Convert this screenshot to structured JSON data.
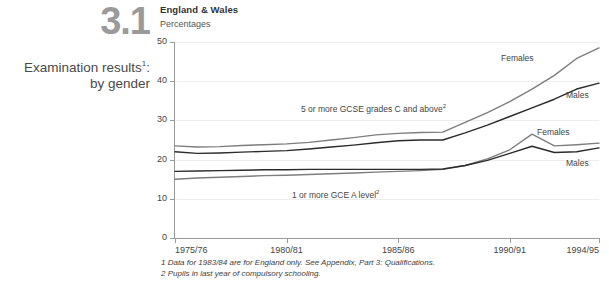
{
  "figure": {
    "number": "3.1",
    "title_line1": "Examination results",
    "title_sup": "1",
    "title_line1_suffix": ":",
    "title_line2": "by gender",
    "region": "England & Wales",
    "units": "Percentages"
  },
  "footnotes": [
    "1 Data for 1983/84 are for England only. See Appendix, Part 3: Qualifications.",
    "2 Pupils in last year of compulsory schooling."
  ],
  "annotations": {
    "gcse": "5 or more GCSE grades C and above",
    "gcse_sup": "2",
    "alevel": "1 or more GCE A level",
    "alevel_sup": "2",
    "gcse_females": "Females",
    "gcse_males": "Males",
    "alevel_females": "Females",
    "alevel_males": "Males"
  },
  "colors": {
    "females_line": "#7d7d7d",
    "males_line": "#2b2b2b",
    "grid": "#ededed",
    "axis": "#9a9a9a",
    "figure_number": "#9a9a9a"
  },
  "chart_data": {
    "type": "line",
    "subtitle": "England & Wales",
    "xlabel": "",
    "ylabel": "Percentages",
    "ylim": [
      0,
      50
    ],
    "yticks": [
      0,
      10,
      20,
      30,
      40,
      50
    ],
    "ytick_labels": [
      "0",
      "10",
      "20",
      "30",
      "40",
      "50"
    ],
    "grid": true,
    "legend": "inline-labels",
    "x": [
      "1975/76",
      "1976/77",
      "1977/78",
      "1978/79",
      "1979/80",
      "1980/81",
      "1981/82",
      "1982/83",
      "1983/84",
      "1984/85",
      "1985/86",
      "1986/87",
      "1987/88",
      "1988/89",
      "1989/90",
      "1990/91",
      "1991/92",
      "1992/93",
      "1993/94",
      "1994/95"
    ],
    "xtick_labels": [
      "1975/76",
      "1980/81",
      "1985/86",
      "1990/91",
      "1994/95"
    ],
    "xtick_positions": [
      0,
      5,
      10,
      15,
      19
    ],
    "series": [
      {
        "name": "5 or more GCSE grades C and above - Females",
        "group": "5 or more GCSE grades C and above",
        "gender": "Females",
        "color": "#7d7d7d",
        "values": [
          23.5,
          23.2,
          23.3,
          23.6,
          23.8,
          24.0,
          24.4,
          25.0,
          25.6,
          26.3,
          26.7,
          26.9,
          27.0,
          29.5,
          32.0,
          34.8,
          38.0,
          41.5,
          45.8,
          48.5
        ]
      },
      {
        "name": "5 or more GCSE grades C and above - Males",
        "group": "5 or more GCSE grades C and above",
        "gender": "Males",
        "color": "#2b2b2b",
        "values": [
          22.0,
          21.6,
          21.7,
          21.9,
          22.1,
          22.3,
          22.7,
          23.2,
          23.7,
          24.3,
          24.8,
          25.0,
          25.0,
          26.8,
          28.8,
          31.0,
          33.2,
          35.4,
          38.0,
          39.5
        ]
      },
      {
        "name": "1 or more GCE A level - Females",
        "group": "1 or more GCE A level",
        "gender": "Females",
        "color": "#7d7d7d",
        "values": [
          15.0,
          15.3,
          15.5,
          15.7,
          15.9,
          16.0,
          16.2,
          16.4,
          16.6,
          16.8,
          17.0,
          17.2,
          17.5,
          18.5,
          20.2,
          22.5,
          26.5,
          23.5,
          23.8,
          24.2
        ]
      },
      {
        "name": "1 or more GCE A level - Males",
        "group": "1 or more GCE A level",
        "gender": "Males",
        "color": "#2b2b2b",
        "values": [
          17.0,
          17.1,
          17.2,
          17.3,
          17.4,
          17.4,
          17.5,
          17.5,
          17.5,
          17.5,
          17.5,
          17.5,
          17.6,
          18.5,
          19.8,
          21.6,
          23.4,
          21.8,
          22.0,
          23.0
        ]
      }
    ]
  }
}
